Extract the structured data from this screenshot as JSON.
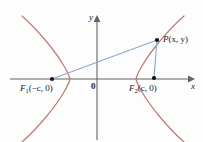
{
  "figure": {
    "colors": {
      "curve": "#bd7d76",
      "segment": "#8aaacd",
      "axis": "#636363",
      "text": "#1a1a1a",
      "dot": "#111111",
      "background": "#fdfdfd"
    },
    "axes": {
      "x_label": "x",
      "y_label": "y",
      "origin_label": "0",
      "x_axis_y_px": 79,
      "y_axis_x_px": 97,
      "x_axis_start_px": 10,
      "x_axis_end_px": 192,
      "y_axis_start_px": 17,
      "y_axis_end_px": 140
    },
    "points": [
      {
        "name": "focus-left",
        "label_main": "F",
        "label_sub": "1",
        "label_tail": "(−c, 0)",
        "full_label": "F₁(−c, 0)",
        "x_px": 52,
        "y_px": 79,
        "label_x_px": 20,
        "label_y_px": 84
      },
      {
        "name": "focus-right",
        "label_main": "F",
        "label_sub": "2",
        "label_tail": "(c, 0)",
        "full_label": "F₂(c, 0)",
        "x_px": 154,
        "y_px": 78,
        "label_x_px": 129,
        "label_y_px": 84
      },
      {
        "name": "point-p",
        "label_main": "P",
        "label_sub": "",
        "label_tail": "(x, y)",
        "full_label": "P(x, y)",
        "x_px": 157,
        "y_px": 40,
        "label_x_px": 164,
        "label_y_px": 36
      }
    ],
    "segments": [
      {
        "name": "segment-f1-p",
        "from": "focus-left",
        "to": "point-p"
      },
      {
        "name": "segment-f2-p",
        "from": "focus-right",
        "to": "point-p"
      }
    ],
    "curve": {
      "type": "hyperbola",
      "left_vertex_x_px": 70,
      "right_vertex_x_px": 136,
      "center_x_px": 103,
      "center_y_px": 79,
      "a_px": 33,
      "b_px": 46
    }
  }
}
